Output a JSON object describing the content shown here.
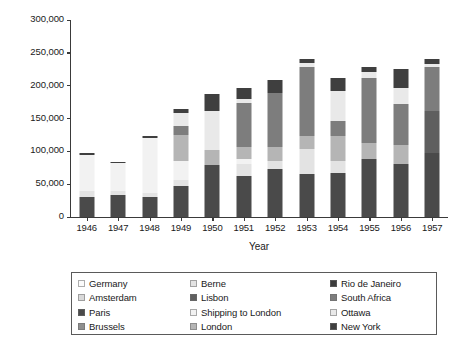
{
  "chart_data": {
    "type": "bar",
    "stacked": true,
    "title": "",
    "xlabel": "Year",
    "ylabel": "1,000 Gold Swiss francs",
    "ylim": [
      0,
      300000
    ],
    "ytick_values": [
      0,
      50000,
      100000,
      150000,
      200000,
      250000,
      300000
    ],
    "ytick_labels": [
      "0",
      "50,000",
      "100,000",
      "150,000",
      "200,000",
      "250,000",
      "300,000"
    ],
    "grid": false,
    "legend_position": "below",
    "categories": [
      "1946",
      "1947",
      "1948",
      "1949",
      "1950",
      "1951",
      "1952",
      "1953",
      "1954",
      "1955",
      "1956",
      "1957"
    ],
    "series": [
      {
        "name": "Germany",
        "color": "#fbfbfb",
        "values": [
          0,
          0,
          0,
          0,
          0,
          0,
          0,
          0,
          0,
          0,
          0,
          0
        ]
      },
      {
        "name": "Amsterdam",
        "color": "#d9d9d9",
        "values": [
          0,
          0,
          0,
          0,
          0,
          0,
          0,
          0,
          0,
          0,
          0,
          0
        ]
      },
      {
        "name": "Paris",
        "color": "#4a4a4a",
        "values": [
          31000,
          33000,
          31000,
          47000,
          79000,
          63000,
          73000,
          66000,
          67000,
          88000,
          80000,
          97000
        ]
      },
      {
        "name": "Brussels",
        "color": "#8f8f8f",
        "values": [
          0,
          0,
          0,
          0,
          0,
          0,
          0,
          0,
          0,
          0,
          0,
          0
        ]
      },
      {
        "name": "Berne",
        "color": "#e3e3e3",
        "values": [
          8000,
          7000,
          6000,
          9000,
          0,
          17000,
          13000,
          37000,
          18000,
          0,
          0,
          0
        ]
      },
      {
        "name": "Lisbon",
        "color": "#5f5f5f",
        "values": [
          0,
          0,
          0,
          0,
          0,
          0,
          0,
          0,
          0,
          0,
          0,
          64000
        ]
      },
      {
        "name": "Shipping to London",
        "color": "#f2f2f2",
        "values": [
          56000,
          42000,
          83000,
          29000,
          0,
          8000,
          0,
          0,
          0,
          0,
          0,
          0
        ]
      },
      {
        "name": "London",
        "color": "#b5b5b5",
        "values": [
          0,
          0,
          0,
          40000,
          23000,
          18000,
          20000,
          20000,
          39000,
          24000,
          29000,
          0
        ]
      },
      {
        "name": "Rio de Janeiro",
        "color": "#3c3c3c",
        "values": [
          0,
          0,
          0,
          0,
          0,
          0,
          0,
          0,
          0,
          0,
          0,
          0
        ]
      },
      {
        "name": "South Africa",
        "color": "#7d7d7d",
        "values": [
          0,
          0,
          0,
          14000,
          0,
          68000,
          83000,
          105000,
          23000,
          99000,
          63000,
          67000
        ]
      },
      {
        "name": "Ottawa",
        "color": "#e9e9e9",
        "values": [
          0,
          0,
          0,
          19000,
          59000,
          6000,
          0,
          7000,
          45000,
          10000,
          25000,
          5000
        ]
      },
      {
        "name": "New York",
        "color": "#3f3f3f",
        "values": [
          3000,
          2000,
          4000,
          7000,
          26000,
          16000,
          19000,
          5000,
          20000,
          7000,
          28000,
          7000
        ]
      }
    ],
    "totals": [
      98000,
      84000,
      124000,
      165000,
      187000,
      196000,
      208000,
      240000,
      212000,
      228000,
      225000,
      240000
    ]
  },
  "legend": {
    "columns": 3,
    "rows": 4,
    "entries": [
      {
        "label": "Germany",
        "color": "#fbfbfb"
      },
      {
        "label": "Berne",
        "color": "#e3e3e3"
      },
      {
        "label": "Rio de Janeiro",
        "color": "#3c3c3c"
      },
      {
        "label": "Amsterdam",
        "color": "#d9d9d9"
      },
      {
        "label": "Lisbon",
        "color": "#5f5f5f"
      },
      {
        "label": "South Africa",
        "color": "#7d7d7d"
      },
      {
        "label": "Paris",
        "color": "#4a4a4a"
      },
      {
        "label": "Shipping to London",
        "color": "#f2f2f2"
      },
      {
        "label": "Ottawa",
        "color": "#e9e9e9"
      },
      {
        "label": "Brussels",
        "color": "#8f8f8f"
      },
      {
        "label": "London",
        "color": "#b5b5b5"
      },
      {
        "label": "New York",
        "color": "#3f3f3f"
      }
    ]
  }
}
